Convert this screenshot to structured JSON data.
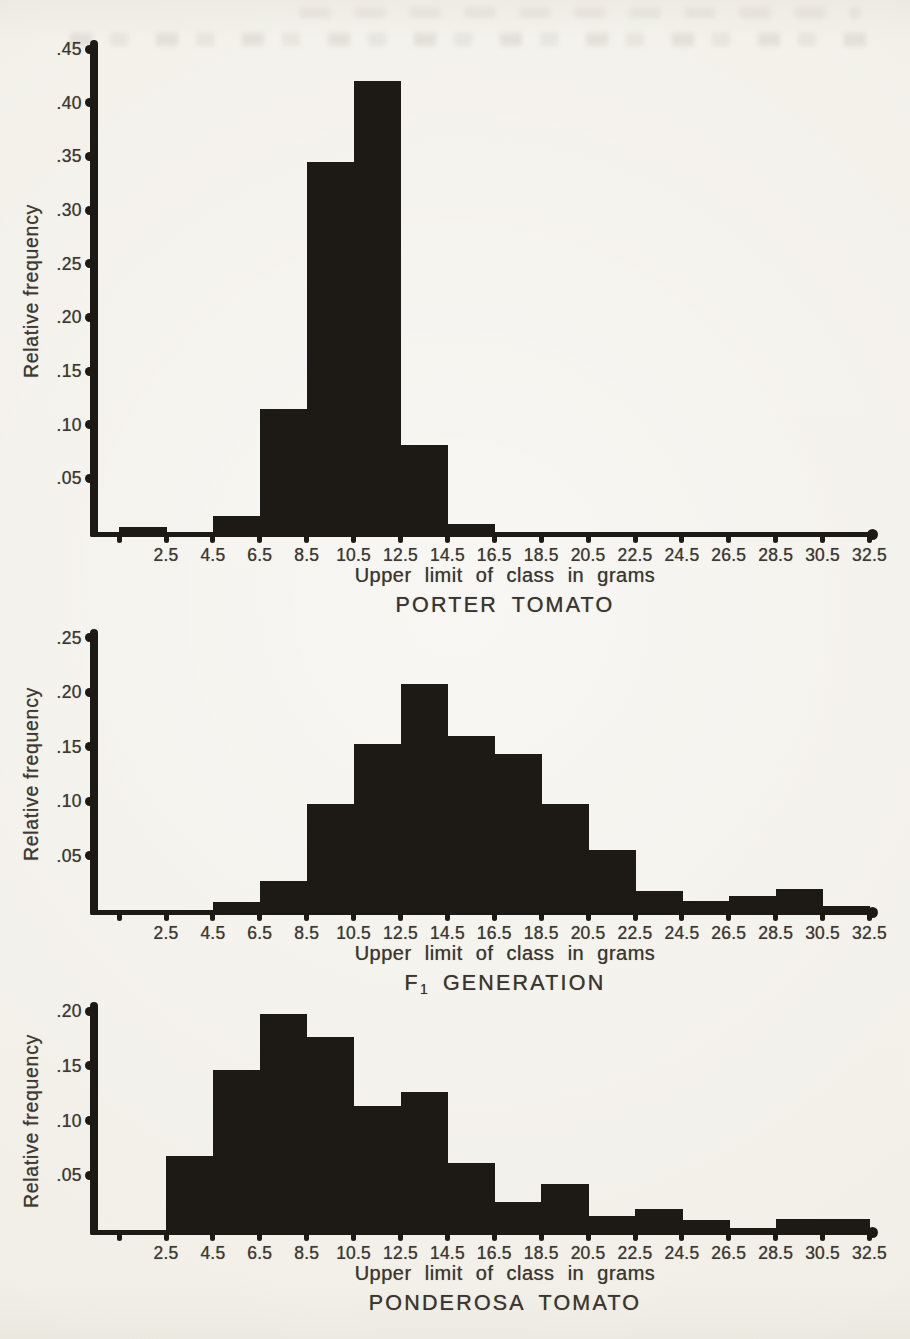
{
  "page": {
    "background_color": "#f1ede6",
    "ink_color": "#1d1915",
    "text_color": "#3e3933"
  },
  "chart_data": [
    {
      "type": "bar",
      "name": "porter-tomato",
      "title_segments": [
        {
          "text": "PORTER TOMATO",
          "subscript": false
        }
      ],
      "xlabel": "Upper limit of class in grams",
      "ylabel": "Relative frequency",
      "categories": [
        2.5,
        4.5,
        6.5,
        8.5,
        10.5,
        12.5,
        14.5,
        16.5,
        18.5,
        20.5,
        22.5,
        24.5,
        26.5,
        28.5,
        30.5,
        32.5
      ],
      "x_tick_labels": [
        "2.5",
        "4.5",
        "6.5",
        "8.5",
        "10.5",
        "12.5",
        "14.5",
        "16.5",
        "18.5",
        "20.5",
        "22.5",
        "24.5",
        "26.5",
        "28.5",
        "30.5",
        "32.5"
      ],
      "values": [
        0.005,
        0,
        0.015,
        0.115,
        0.345,
        0.42,
        0.081,
        0.007,
        0,
        0,
        0,
        0,
        0,
        0,
        0,
        0
      ],
      "y_ticks": [
        {
          "v": 0.05,
          "label": ".05"
        },
        {
          "v": 0.1,
          "label": ".10"
        },
        {
          "v": 0.15,
          "label": ".15"
        },
        {
          "v": 0.2,
          "label": ".20"
        },
        {
          "v": 0.25,
          "label": ".25"
        },
        {
          "v": 0.3,
          "label": ".30"
        },
        {
          "v": 0.35,
          "label": ".35"
        },
        {
          "v": 0.4,
          "label": ".40"
        },
        {
          "v": 0.45,
          "label": ".45"
        }
      ],
      "ylim": [
        0,
        0.45
      ],
      "bin_width_grams": 2,
      "grid": false,
      "legend": "none"
    },
    {
      "type": "bar",
      "name": "f1-generation",
      "title_segments": [
        {
          "text": "F",
          "subscript": false
        },
        {
          "text": "1",
          "subscript": true
        },
        {
          "text": " GENERATION",
          "subscript": false
        }
      ],
      "xlabel": "Upper limit of class in grams",
      "ylabel": "Relative frequency",
      "categories": [
        2.5,
        4.5,
        6.5,
        8.5,
        10.5,
        12.5,
        14.5,
        16.5,
        18.5,
        20.5,
        22.5,
        24.5,
        26.5,
        28.5,
        30.5,
        32.5
      ],
      "x_tick_labels": [
        "2.5",
        "4.5",
        "6.5",
        "8.5",
        "10.5",
        "12.5",
        "14.5",
        "16.5",
        "18.5",
        "20.5",
        "22.5",
        "24.5",
        "26.5",
        "28.5",
        "30.5",
        "32.5"
      ],
      "values": [
        0,
        0,
        0.007,
        0.027,
        0.097,
        0.152,
        0.207,
        0.16,
        0.143,
        0.097,
        0.055,
        0.017,
        0.008,
        0.013,
        0.019,
        0.004
      ],
      "y_ticks": [
        {
          "v": 0.05,
          "label": ".05"
        },
        {
          "v": 0.1,
          "label": ".10"
        },
        {
          "v": 0.15,
          "label": ".15"
        },
        {
          "v": 0.2,
          "label": ".20"
        },
        {
          "v": 0.25,
          "label": ".25"
        }
      ],
      "ylim": [
        0,
        0.25
      ],
      "bin_width_grams": 2,
      "grid": false,
      "legend": "none"
    },
    {
      "type": "bar",
      "name": "ponderosa-tomato",
      "title_segments": [
        {
          "text": "PONDEROSA TOMATO",
          "subscript": false
        }
      ],
      "xlabel": "Upper limit of class in grams",
      "ylabel": "Relative frequency",
      "categories": [
        2.5,
        4.5,
        6.5,
        8.5,
        10.5,
        12.5,
        14.5,
        16.5,
        18.5,
        20.5,
        22.5,
        24.5,
        26.5,
        28.5,
        30.5,
        32.5
      ],
      "x_tick_labels": [
        "2.5",
        "4.5",
        "6.5",
        "8.5",
        "10.5",
        "12.5",
        "14.5",
        "16.5",
        "18.5",
        "20.5",
        "22.5",
        "24.5",
        "26.5",
        "28.5",
        "30.5",
        "32.5"
      ],
      "values": [
        0,
        0.068,
        0.146,
        0.197,
        0.176,
        0.113,
        0.126,
        0.061,
        0.026,
        0.042,
        0.013,
        0.019,
        0.009,
        0.002,
        0.01,
        0.01
      ],
      "y_ticks": [
        {
          "v": 0.05,
          "label": ".05"
        },
        {
          "v": 0.1,
          "label": ".10"
        },
        {
          "v": 0.15,
          "label": ".15"
        },
        {
          "v": 0.2,
          "label": ".20"
        }
      ],
      "ylim": [
        0,
        0.2
      ],
      "bin_width_grams": 2,
      "grid": false,
      "legend": "none"
    }
  ]
}
